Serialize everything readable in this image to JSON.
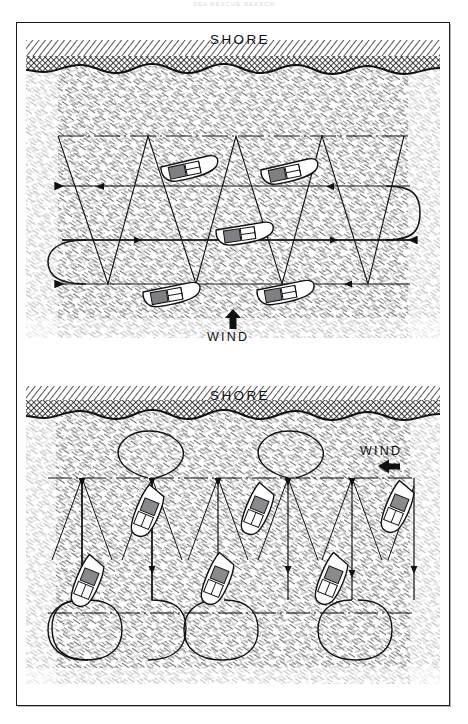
{
  "page": {
    "running_head": "SEA RESCUE SEARCH",
    "background_color": "#ffffff",
    "ink_color": "#111111"
  },
  "plate": {
    "frame": {
      "x": 16,
      "y": 22,
      "width": 434,
      "height": 684,
      "border_color": "#1b1b1b"
    }
  },
  "figures": [
    {
      "id": "parallel-track-search",
      "name": "upper-diagram",
      "labels": {
        "shore": "SHORE",
        "wind": "WIND"
      },
      "wind_direction": "up",
      "wind_arrow_icon": "arrow-up-icon",
      "shore_position": "top",
      "track_legs": 3,
      "boats": 5,
      "boat_heading": "horizontal",
      "geometry": {
        "frame": {
          "x": 26,
          "y": 30,
          "width": 414,
          "height": 322
        },
        "shore_band": {
          "y": 42,
          "height": 30
        },
        "water": {
          "y": 72,
          "height": 262
        },
        "zigzag_top_y": 136,
        "track_lines_y": [
          136,
          186,
          240,
          284
        ],
        "turn_radius": 26,
        "boat_positions": [
          {
            "x": 190,
            "y": 169,
            "rot": -12
          },
          {
            "x": 290,
            "y": 172,
            "rot": -12
          },
          {
            "x": 245,
            "y": 235,
            "rot": -8
          },
          {
            "x": 170,
            "y": 296,
            "rot": -10
          },
          {
            "x": 285,
            "y": 293,
            "rot": -10
          }
        ]
      }
    },
    {
      "id": "creeping-line-search",
      "name": "lower-diagram",
      "labels": {
        "shore": "SHORE",
        "wind": "WIND"
      },
      "wind_direction": "left",
      "wind_arrow_icon": "arrow-left-icon",
      "shore_position": "top",
      "track_legs": 4,
      "boats": 6,
      "boat_heading": "vertical",
      "geometry": {
        "frame": {
          "x": 26,
          "y": 374,
          "width": 414,
          "height": 322
        },
        "shore_band": {
          "y": 388,
          "height": 28
        },
        "water": {
          "y": 416,
          "height": 262
        },
        "centerline_y": 478,
        "lower_dash_y": 613,
        "loop_top_y": 446,
        "loop_bottom_y": 660,
        "boat_positions": [
          {
            "x": 148,
            "y": 512,
            "rot": 22
          },
          {
            "x": 258,
            "y": 510,
            "rot": 22
          },
          {
            "x": 396,
            "y": 508,
            "rot": 22
          },
          {
            "x": 88,
            "y": 582,
            "rot": 22
          },
          {
            "x": 218,
            "y": 580,
            "rot": 22
          },
          {
            "x": 330,
            "y": 580,
            "rot": 22
          }
        ]
      }
    }
  ]
}
